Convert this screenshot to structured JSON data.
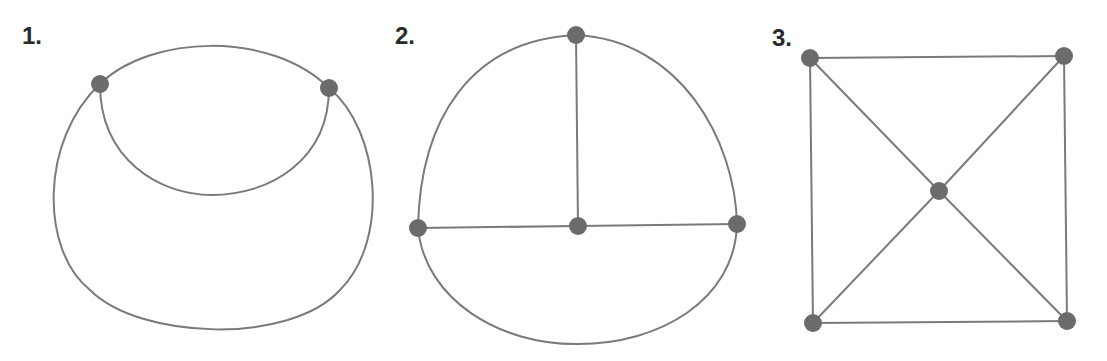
{
  "figures": [
    {
      "label": "1.",
      "description": "Two vertices joined by an upper arc, a lower inner arc, and a large outer arc"
    },
    {
      "label": "2.",
      "description": "Four vertices: top, left, center, right; center joined to top, left, right; outer curves connect top-left, top-right, and left-right along bottom"
    },
    {
      "label": "3.",
      "description": "Square with five vertices: four corners and a center vertex joined to each corner"
    }
  ],
  "style": {
    "edge_color": "#7a7a7a",
    "node_color": "#6b6b6b",
    "label_color": "#2a2a2a"
  }
}
